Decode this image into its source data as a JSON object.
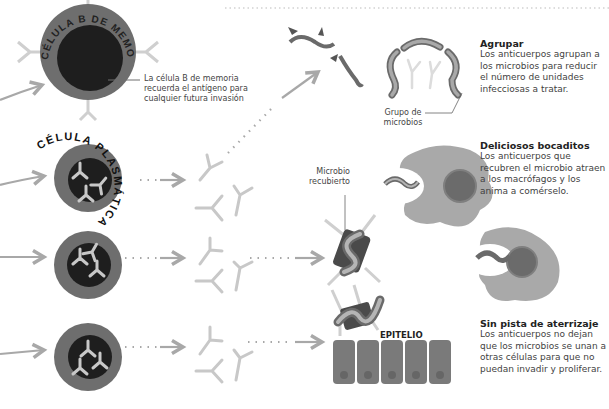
{
  "cells": {
    "memory_label": "CÉLULA B DE MEMORIA",
    "plasma_label": "CÉLULA PLASMÁTICA",
    "memory_caption": "La célula B de memoria recuerda el antígeno para cualquier futura invasión"
  },
  "labels": {
    "microbe_group": "Grupo de microbios",
    "coated_microbe": "Microbio recubierto",
    "epithelium": "EPITELIO"
  },
  "sections": [
    {
      "title": "Agrupar",
      "body": "Los anticuerpos agrupan a los microbios para reducir el número de unidades infecciosas a tratar."
    },
    {
      "title": "Deliciosos bocaditos",
      "body": "Los anticuerpos que recubren el microbio atraen a los macrófagos y los anima a comérselo."
    },
    {
      "title": "Sin pista de aterrizaje",
      "body": "Los anticuerpos no dejan que los microbios se unan a otras células para que no puedan invadir y proliferar."
    }
  ],
  "colors": {
    "cell_outer": "#6e6e6e",
    "cell_inner": "#1e1e1e",
    "antibody": "#c8c8c8",
    "arrow": "#a8a8a8",
    "macrophage": "#a9a9a9",
    "microbe": "#8a8a8a"
  }
}
